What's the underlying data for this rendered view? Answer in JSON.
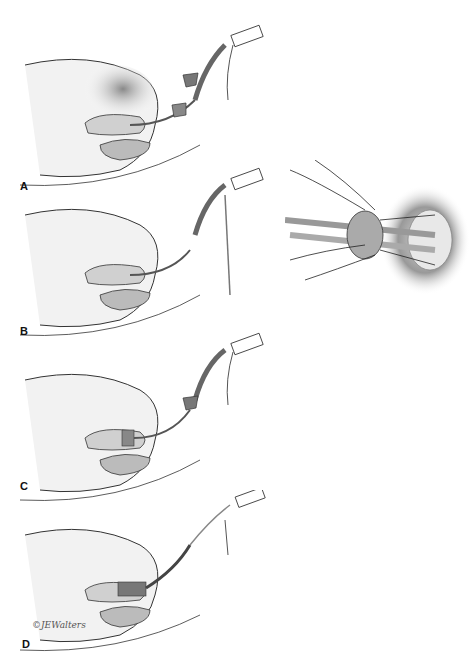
{
  "figure": {
    "panels": [
      {
        "label": "A",
        "top": 5
      },
      {
        "label": "B",
        "top": 165
      },
      {
        "label": "C",
        "top": 330
      },
      {
        "label": "D",
        "top": 490
      }
    ],
    "signature": "©JEWalters",
    "colors": {
      "line": "#222222",
      "tissue": "#e6e6e6",
      "organ": "#bdbdbd",
      "shade": "#9a9a9a",
      "device": "#707070"
    }
  }
}
